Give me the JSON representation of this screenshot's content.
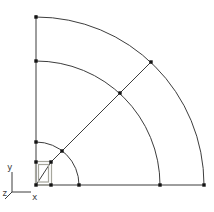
{
  "canvas": {
    "width": 214,
    "height": 212,
    "background": "#ffffff"
  },
  "style": {
    "line_color": "#3d3d3d",
    "line_width": 1,
    "keypoint_color": "#141414",
    "keypoint_size": 3.4,
    "area_frame_color": "#a6a69c",
    "label_color": "#3d3d3d",
    "label_font_size": 9
  },
  "origin": {
    "x": 36,
    "y": 185
  },
  "boundary_lines": [
    {
      "name": "vertical-edge-line",
      "x1": 36,
      "y1": 185,
      "x2": 36,
      "y2": 15
    },
    {
      "name": "horizontal-edge-line",
      "x1": 36,
      "y1": 185,
      "x2": 205,
      "y2": 185
    }
  ],
  "arcs": [
    {
      "name": "inner-arc",
      "radius": 43,
      "start": [
        36,
        142
      ],
      "end": [
        79,
        185
      ]
    },
    {
      "name": "middle-arc",
      "radius": 124,
      "start": [
        36,
        61
      ],
      "end": [
        160,
        185
      ]
    },
    {
      "name": "outer-arc",
      "radius": 168,
      "start": [
        36,
        17
      ],
      "end": [
        204,
        185
      ]
    }
  ],
  "radial_line": {
    "name": "diagonal-radial-line",
    "points": [
      [
        36,
        185
      ],
      [
        51,
        162
      ],
      [
        151,
        62
      ]
    ]
  },
  "center_square": {
    "outer": {
      "x": 35.5,
      "y": 161.5,
      "w": 16,
      "h": 23.5
    },
    "inner": {
      "x": 38.5,
      "y": 164.5,
      "w": 10,
      "h": 17.5
    }
  },
  "keypoints": [
    [
      36,
      17
    ],
    [
      36,
      61
    ],
    [
      36,
      142
    ],
    [
      36,
      162
    ],
    [
      36,
      185
    ],
    [
      51,
      162
    ],
    [
      51,
      185
    ],
    [
      79,
      185
    ],
    [
      160,
      185
    ],
    [
      204,
      185
    ],
    [
      62,
      151
    ],
    [
      120,
      93
    ],
    [
      151,
      62
    ]
  ],
  "triad": {
    "lines": [
      {
        "name": "triad-y-axis-line",
        "x1": 12,
        "y1": 172,
        "x2": 12,
        "y2": 192
      },
      {
        "name": "triad-x-axis-line",
        "x1": 12,
        "y1": 192,
        "x2": 31,
        "y2": 192
      },
      {
        "name": "triad-z-axis-line",
        "x1": 12,
        "y1": 192,
        "x2": 5,
        "y2": 199
      }
    ],
    "labels": [
      {
        "name": "y-axis-label",
        "text": "y",
        "x": 7,
        "y": 170
      },
      {
        "name": "x-axis-label",
        "text": "x",
        "x": 32,
        "y": 200
      },
      {
        "name": "z-axis-label",
        "text": "z",
        "x": 2,
        "y": 196
      }
    ]
  }
}
